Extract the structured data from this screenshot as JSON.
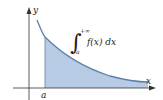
{
  "figure": {
    "axis_labels": {
      "x": "x",
      "y": "y"
    },
    "lower_limit_label": "a",
    "integral": {
      "symbol": "∫",
      "lower": "a",
      "upper": "+∞",
      "integrand": "f(x) dx"
    },
    "colors": {
      "fill": "#b7cce4",
      "curve": "#5b80ab",
      "axes": "#333333",
      "edge": "#7d93ad"
    }
  }
}
